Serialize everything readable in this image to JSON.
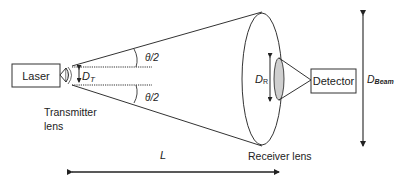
{
  "diagram": {
    "laser_label": "Laser",
    "detector_label": "Detector",
    "transmitter_lens_label_line1": "Transmitter",
    "transmitter_lens_label_line2": "lens",
    "receiver_lens_label": "Receiver lens",
    "theta_top": "θ/2",
    "theta_bottom": "θ/2",
    "dt_main": "D",
    "dt_sub": "T",
    "dr_main": "D",
    "dr_sub": "R",
    "dbeam_main": "D",
    "dbeam_sub": "Beam",
    "length_label": "L",
    "colors": {
      "line": "#222222",
      "lens_fill": "#cfcfcf",
      "background": "#ffffff"
    }
  }
}
